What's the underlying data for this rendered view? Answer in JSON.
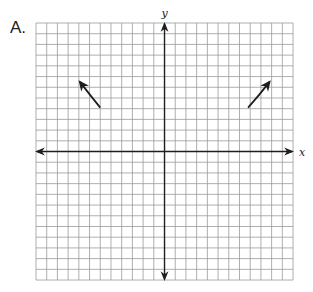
{
  "figure": {
    "label": "A.",
    "x_axis_label": "x",
    "y_axis_label": "y"
  },
  "grid": {
    "columns": 24,
    "rows": 24,
    "left_px": 36,
    "top_px": 23,
    "cell_px": 10.71,
    "line_color": "#9a9a9a",
    "axis_color": "#1e1e1e"
  },
  "chart_data": {
    "type": "line",
    "title": "",
    "xlabel": "x",
    "ylabel": "y",
    "xlim": [
      -12,
      12
    ],
    "ylim": [
      -12,
      12
    ],
    "grid": true,
    "series": [
      {
        "name": "left-end-behavior",
        "x": [
          -6.0,
          -6.9,
          -7.9
        ],
        "y": [
          4.1,
          5.2,
          6.5
        ],
        "arrow": "end"
      },
      {
        "name": "right-end-behavior",
        "x": [
          7.8,
          8.8,
          9.8
        ],
        "y": [
          4.1,
          5.2,
          6.5
        ],
        "arrow": "end"
      }
    ]
  }
}
